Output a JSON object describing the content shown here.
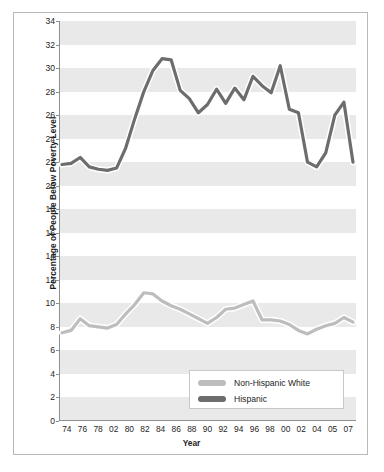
{
  "chart_data": {
    "type": "line",
    "title": "",
    "xlabel": "Year",
    "ylabel": "Percentage of People Below Poverty Level",
    "ylim": [
      0,
      34
    ],
    "yticks": [
      0,
      2,
      4,
      6,
      8,
      10,
      12,
      14,
      16,
      18,
      20,
      22,
      24,
      26,
      28,
      30,
      32,
      34
    ],
    "xticks": [
      "74",
      "76",
      "78",
      "02",
      "80",
      "82",
      "84",
      "86",
      "88",
      "90",
      "92",
      "94",
      "96",
      "98",
      "00",
      "02",
      "04",
      "05",
      "07"
    ],
    "x": [
      1973,
      1974,
      1975,
      1976,
      1977,
      1978,
      1979,
      1980,
      1981,
      1982,
      1983,
      1984,
      1985,
      1986,
      1987,
      1988,
      1989,
      1990,
      1991,
      1992,
      1993,
      1994,
      1995,
      1996,
      1997,
      1998,
      1999,
      2000,
      2001,
      2002,
      2003,
      2004,
      2005
    ],
    "grid": "horizontal-bands",
    "legend_position": "bottom-center",
    "series": [
      {
        "name": "Non-Hispanic White",
        "color": "#bdbdbd",
        "values": [
          7.5,
          7.7,
          8.7,
          8.1,
          8.0,
          7.9,
          8.2,
          9.1,
          9.9,
          10.9,
          10.8,
          10.2,
          9.8,
          9.5,
          9.1,
          8.7,
          8.3,
          8.8,
          9.5,
          9.6,
          9.9,
          10.2,
          8.6,
          8.6,
          8.5,
          8.2,
          7.7,
          7.4,
          7.8,
          8.1,
          8.3,
          8.8,
          8.4
        ]
      },
      {
        "name": "Hispanic",
        "color": "#6d6d6d",
        "values": [
          21.8,
          21.9,
          22.4,
          21.6,
          21.4,
          21.3,
          21.5,
          23.2,
          25.7,
          28.0,
          29.8,
          30.8,
          30.7,
          28.1,
          27.4,
          26.2,
          26.9,
          28.2,
          27.0,
          28.3,
          27.3,
          29.3,
          28.5,
          27.9,
          30.2,
          26.5,
          26.2,
          22.0,
          21.6,
          22.8,
          26.0,
          27.1,
          22.0
        ]
      }
    ]
  },
  "legend": {
    "items": [
      {
        "label": "Non-Hispanic White",
        "color": "#bdbdbd"
      },
      {
        "label": "Hispanic",
        "color": "#6d6d6d"
      }
    ]
  }
}
